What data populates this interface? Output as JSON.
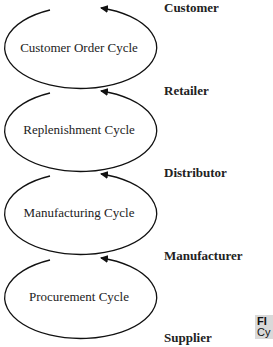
{
  "diagram": {
    "cycles": [
      {
        "label": "Customer Order Cycle",
        "cy": 49
      },
      {
        "label": "Replenishment Cycle",
        "cy": 132
      },
      {
        "label": "Manufacturing Cycle",
        "cy": 215
      },
      {
        "label": "Procurement Cycle",
        "cy": 299
      }
    ],
    "stages": [
      {
        "label": "Customer",
        "y": 1
      },
      {
        "label": "Retailer",
        "y": 83
      },
      {
        "label": "Distributor",
        "y": 165
      },
      {
        "label": "Manufacturer",
        "y": 248
      },
      {
        "label": "Supplier",
        "y": 330
      }
    ],
    "figure_caption": {
      "prefix": "FI",
      "text": "Cy"
    }
  }
}
